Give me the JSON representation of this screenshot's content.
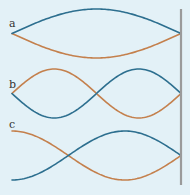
{
  "colors": {
    "background": "#e3f1f7",
    "wave_blue": "#2d6f8f",
    "wave_orange": "#c4804d",
    "wall": "#9a9a9a"
  },
  "wall": {
    "x": 181,
    "y_top": 9,
    "y_bottom": 185
  },
  "panels": [
    {
      "label": "a",
      "label_pos": [
        9,
        27
      ],
      "x_start": 12,
      "x_end": 181,
      "center_y": 33.5,
      "amplitude": 24.5,
      "quarter_wavelengths": 2,
      "start_phase": "node",
      "blue_sign": -1
    },
    {
      "label": "b",
      "label_pos": [
        9,
        88
      ],
      "x_start": 12,
      "x_end": 181,
      "center_y": 93.5,
      "amplitude": 24.5,
      "quarter_wavelengths": 4,
      "start_phase": "node",
      "blue_sign": 1
    },
    {
      "label": "c",
      "label_pos": [
        9,
        128
      ],
      "x_start": 12,
      "x_end": 181,
      "center_y": 155.5,
      "amplitude": 24.5,
      "quarter_wavelengths": 3,
      "start_phase": "antinode",
      "blue_sign": -1
    }
  ]
}
